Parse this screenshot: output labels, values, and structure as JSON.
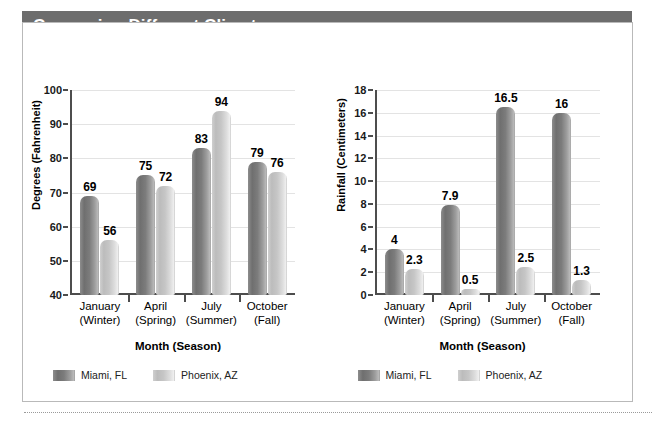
{
  "header": {
    "title": "Comparing Different Climates",
    "bar_color": "#6d6d6d",
    "text_color": "#ffffff"
  },
  "series_colors": {
    "miami": "#7c7c7c",
    "phoenix": "#c6c6c6"
  },
  "legend": {
    "miami_label": "Miami, FL",
    "phoenix_label": "Phoenix, AZ"
  },
  "chart_data": [
    {
      "type": "bar",
      "title": "",
      "xlabel": "Month (Season)",
      "ylabel": "Degrees (Fahrenheit)",
      "categories": [
        "January",
        "April",
        "July",
        "October"
      ],
      "category_sublabels": [
        "(Winter)",
        "(Spring)",
        "(Summer)",
        "(Fall)"
      ],
      "ylim": [
        40,
        100
      ],
      "yticks": [
        40,
        50,
        60,
        70,
        80,
        90,
        100
      ],
      "ytick_labels": [
        "40",
        "50",
        "60",
        "70",
        "80",
        "90",
        "100"
      ],
      "grid": true,
      "legend_position": "bottom-left",
      "series": [
        {
          "name": "Miami, FL",
          "values": [
            69,
            75,
            83,
            79
          ],
          "labels": [
            "69",
            "75",
            "83",
            "79"
          ]
        },
        {
          "name": "Phoenix, AZ",
          "values": [
            56,
            72,
            94,
            76
          ],
          "labels": [
            "56",
            "72",
            "94",
            "76"
          ]
        }
      ]
    },
    {
      "type": "bar",
      "title": "",
      "xlabel": "Month (Season)",
      "ylabel": "Rainfall (Centimeters)",
      "categories": [
        "January",
        "April",
        "July",
        "October"
      ],
      "category_sublabels": [
        "(Winter)",
        "(Spring)",
        "(Summer)",
        "(Fall)"
      ],
      "ylim": [
        0,
        18
      ],
      "yticks": [
        0,
        2,
        4,
        6,
        8,
        10,
        12,
        14,
        16,
        18
      ],
      "ytick_labels": [
        "0",
        "2",
        "4",
        "6",
        "8",
        "10",
        "12",
        "14",
        "16",
        "18"
      ],
      "grid": true,
      "legend_position": "bottom-left",
      "series": [
        {
          "name": "Miami, FL",
          "values": [
            4,
            7.9,
            16.5,
            16
          ],
          "labels": [
            "4",
            "7.9",
            "16.5",
            "16"
          ]
        },
        {
          "name": "Phoenix, AZ",
          "values": [
            2.3,
            0.5,
            2.5,
            1.3
          ],
          "labels": [
            "2.3",
            "0.5",
            "2.5",
            "1.3"
          ]
        }
      ]
    }
  ]
}
